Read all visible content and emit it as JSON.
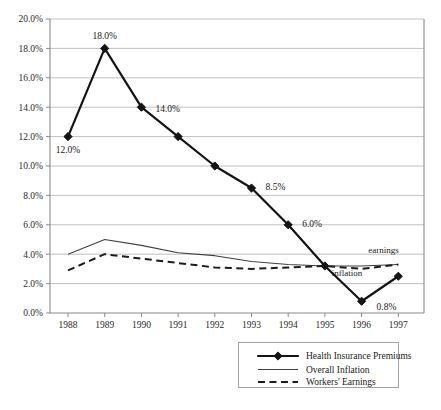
{
  "chart_data": {
    "type": "line",
    "title": "",
    "subtitle": "",
    "xlabel": "",
    "ylabel": "",
    "x": [
      "1988",
      "1989",
      "1990",
      "1991",
      "1992",
      "1993",
      "1994",
      "1995",
      "1996",
      "1997"
    ],
    "categories": [
      "1988",
      "1989",
      "1990",
      "1991",
      "1992",
      "1993",
      "1994",
      "1995",
      "1996",
      "1997"
    ],
    "ylim": [
      0.0,
      20.0
    ],
    "yticks": [
      0.0,
      2.0,
      4.0,
      6.0,
      8.0,
      10.0,
      12.0,
      14.0,
      16.0,
      18.0,
      20.0
    ],
    "ytick_labels": [
      "0.0%",
      "2.0%",
      "4.0%",
      "6.0%",
      "8.0%",
      "10.0%",
      "12.0%",
      "14.0%",
      "16.0%",
      "18.0%",
      "20.0%"
    ],
    "xtick_labels": [
      "1988",
      "1989",
      "1990",
      "1991",
      "1992",
      "1993",
      "1994",
      "1995",
      "1996",
      "1997"
    ],
    "grid": "horizontal",
    "legend_position": "bottom",
    "series": [
      {
        "name": "Health Insurance Premiums",
        "style": "solid-thick-markers",
        "marker": "diamond",
        "values": [
          12.0,
          18.0,
          14.0,
          12.0,
          10.0,
          8.5,
          6.0,
          3.2,
          0.8,
          2.5
        ],
        "data_labels": [
          {
            "x": "1988",
            "value": 12.0,
            "text": "12.0%"
          },
          {
            "x": "1989",
            "value": 18.0,
            "text": "18.0%"
          },
          {
            "x": "1990",
            "value": 14.0,
            "text": "14.0%"
          },
          {
            "x": "1993",
            "value": 8.5,
            "text": "8.5%"
          },
          {
            "x": "1994",
            "value": 6.0,
            "text": "6.0%"
          },
          {
            "x": "1996",
            "value": 0.8,
            "text": "0.8%"
          }
        ]
      },
      {
        "name": "Overall Inflation",
        "style": "solid-thin",
        "values": [
          4.0,
          5.0,
          4.6,
          4.1,
          3.9,
          3.5,
          3.3,
          3.2,
          3.2,
          3.3
        ]
      },
      {
        "name": "Workers' Earnings",
        "style": "dashed",
        "values": [
          2.9,
          4.0,
          3.7,
          3.4,
          3.1,
          3.0,
          3.1,
          3.2,
          3.0,
          3.3
        ]
      }
    ],
    "annotations": [
      {
        "text": "earnings",
        "x": "1996.6",
        "value": 4.1
      },
      {
        "text": "inflation",
        "x": "1995.6",
        "value": 2.5
      }
    ]
  },
  "legend": {
    "items": [
      {
        "label": "Health Insurance Premiums",
        "style": "solid-thick-markers"
      },
      {
        "label": "Overall Inflation",
        "style": "solid-thin"
      },
      {
        "label": "Workers' Earnings",
        "style": "dashed"
      }
    ]
  }
}
